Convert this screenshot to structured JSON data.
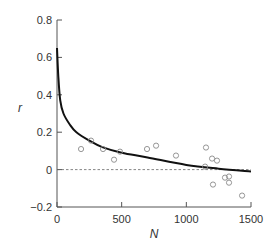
{
  "chart_data": {
    "type": "scatter",
    "title": "",
    "xlabel": "N",
    "ylabel": "r",
    "xlim": [
      0,
      1500
    ],
    "ylim": [
      -0.2,
      0.8
    ],
    "xticks": [
      0,
      500,
      1000,
      1500
    ],
    "xtick_labels": [
      "0",
      "500",
      "1000",
      "1500"
    ],
    "yticks": [
      -0.2,
      0,
      0.2,
      0.4,
      0.6,
      0.8
    ],
    "ytick_labels": [
      "−0.2",
      "0",
      "0.2",
      "0.4",
      "0.6",
      "0.8"
    ],
    "grid": false,
    "legend": null,
    "reference_line": {
      "y": 0,
      "style": "dashed"
    },
    "series": [
      {
        "name": "observations",
        "kind": "scatter",
        "marker": "open-circle",
        "color": "#8a8a8a",
        "points": [
          {
            "x": 186,
            "y": 0.11
          },
          {
            "x": 263,
            "y": 0.155
          },
          {
            "x": 356,
            "y": 0.11
          },
          {
            "x": 441,
            "y": 0.053
          },
          {
            "x": 487,
            "y": 0.096
          },
          {
            "x": 696,
            "y": 0.11
          },
          {
            "x": 766,
            "y": 0.128
          },
          {
            "x": 920,
            "y": 0.075
          },
          {
            "x": 1145,
            "y": 0.016
          },
          {
            "x": 1152,
            "y": 0.118
          },
          {
            "x": 1199,
            "y": 0.059
          },
          {
            "x": 1206,
            "y": -0.08
          },
          {
            "x": 1237,
            "y": 0.048
          },
          {
            "x": 1299,
            "y": -0.043
          },
          {
            "x": 1330,
            "y": -0.037
          },
          {
            "x": 1330,
            "y": -0.07
          },
          {
            "x": 1431,
            "y": -0.139
          }
        ]
      },
      {
        "name": "fitted curve",
        "kind": "line",
        "color": "#111111",
        "points": [
          {
            "x": 0,
            "y": 0.65
          },
          {
            "x": 10,
            "y": 0.5
          },
          {
            "x": 25,
            "y": 0.37
          },
          {
            "x": 50,
            "y": 0.3
          },
          {
            "x": 100,
            "y": 0.24
          },
          {
            "x": 150,
            "y": 0.2
          },
          {
            "x": 250,
            "y": 0.155
          },
          {
            "x": 350,
            "y": 0.12
          },
          {
            "x": 500,
            "y": 0.09
          },
          {
            "x": 700,
            "y": 0.065
          },
          {
            "x": 1000,
            "y": 0.025
          },
          {
            "x": 1250,
            "y": 0.005
          },
          {
            "x": 1500,
            "y": -0.01
          }
        ]
      }
    ]
  },
  "layout": {
    "plot_left": 57,
    "plot_right": 251,
    "plot_top": 20,
    "plot_bottom": 207,
    "axis_color": "#555555",
    "marker_color": "#8a8a8a",
    "curve_color": "#111111"
  }
}
